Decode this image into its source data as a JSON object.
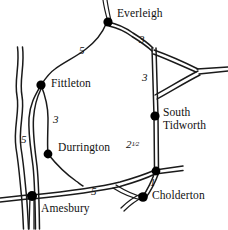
{
  "map": {
    "title": "Road distance map",
    "background_color": "#ffffff",
    "road_color": "#1a1a1a",
    "node_color": "#000000",
    "width": 228,
    "height": 230,
    "places": [
      {
        "id": "everleigh",
        "name": "Everleigh",
        "node": [
          108,
          22
        ],
        "label_pos": [
          117,
          11
        ],
        "label_lines": [
          "Everleigh"
        ]
      },
      {
        "id": "fittleton",
        "name": "Fittleton",
        "node": [
          41,
          85
        ],
        "label_pos": [
          51,
          79
        ],
        "label_lines": [
          "Fittleton"
        ]
      },
      {
        "id": "south-tidworth",
        "name": "South Tidworth",
        "node": [
          155,
          116
        ],
        "label_pos": [
          163,
          109
        ],
        "label_lines": [
          "South",
          "Tidworth"
        ]
      },
      {
        "id": "durrington",
        "name": "Durrington",
        "node": [
          48,
          154
        ],
        "label_pos": [
          58,
          144
        ],
        "label_lines": [
          "Durrington"
        ]
      },
      {
        "id": "amesbury",
        "name": "Amesbury",
        "node": [
          32,
          196
        ],
        "label_pos": [
          41,
          205
        ],
        "label_lines": [
          "Amesbury"
        ]
      },
      {
        "id": "cholderton",
        "name": "Cholderton",
        "node": [
          143,
          197
        ],
        "label_pos": [
          152,
          192
        ],
        "label_lines": [
          "Cholderton"
        ]
      },
      {
        "id": "junction-east",
        "name": "",
        "node": [
          155,
          171
        ],
        "label_pos": null,
        "label_lines": []
      }
    ],
    "distances": [
      {
        "id": "everleigh-fittleton",
        "value": "5",
        "pos": [
          79,
          47
        ],
        "between": [
          "Fittleton",
          "Everleigh"
        ]
      },
      {
        "id": "everleigh-junction",
        "value": "3",
        "pos": [
          139,
          36
        ],
        "between": [
          "Everleigh",
          "triangle junction"
        ]
      },
      {
        "id": "junction-south-tidworth",
        "value": "3",
        "pos": [
          142,
          74
        ],
        "between": [
          "triangle junction",
          "South Tidworth"
        ]
      },
      {
        "id": "south-tidworth-cholderton",
        "value": "2",
        "fraction": "1/2",
        "pos": [
          126,
          141
        ],
        "between": [
          "South Tidworth",
          "Cholderton junction"
        ]
      },
      {
        "id": "cholderton-junction",
        "value": "1",
        "pos": [
          150,
          179
        ],
        "between": [
          "Cholderton",
          "junction"
        ]
      },
      {
        "id": "amesbury-cholderton",
        "value": "5",
        "pos": [
          91,
          188
        ],
        "between": [
          "Amesbury",
          "Cholderton"
        ]
      },
      {
        "id": "amesbury-fittleton-west",
        "value": "5",
        "pos": [
          21,
          136
        ],
        "between": [
          "Amesbury",
          "Fittleton"
        ]
      },
      {
        "id": "fittleton-durrington",
        "value": "3",
        "pos": [
          53,
          116
        ],
        "between": [
          "Fittleton",
          "Durrington"
        ]
      }
    ]
  }
}
